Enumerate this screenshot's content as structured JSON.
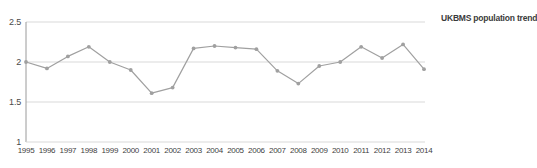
{
  "chart_data": {
    "type": "line",
    "title": "",
    "subtitle": "",
    "xlabel": "",
    "ylabel": "",
    "x": [
      1995,
      1996,
      1997,
      1998,
      1999,
      2000,
      2001,
      2002,
      2003,
      2004,
      2005,
      2006,
      2007,
      2008,
      2009,
      2010,
      2011,
      2012,
      2013,
      2014
    ],
    "categories": [
      "1995",
      "1996",
      "1997",
      "1998",
      "1999",
      "2000",
      "2001",
      "2002",
      "2003",
      "2004",
      "2005",
      "2006",
      "2007",
      "2008",
      "2009",
      "2010",
      "2011",
      "2012",
      "2013",
      "2014"
    ],
    "series": [
      {
        "name": "UKBMS population trend",
        "values": [
          2.0,
          1.92,
          2.07,
          2.19,
          2.0,
          1.9,
          1.61,
          1.68,
          2.17,
          2.2,
          2.18,
          2.16,
          1.89,
          1.73,
          1.95,
          2.0,
          2.19,
          2.05,
          2.22,
          1.91
        ],
        "color": "#a0a0a0",
        "marker": "circle"
      }
    ],
    "legend": {
      "position": "right",
      "entries": [
        "UKBMS population trend"
      ]
    },
    "yticks": [
      1,
      1.5,
      2,
      2.5
    ],
    "ytick_labels": [
      "1",
      "1.5",
      "2",
      "2.5"
    ],
    "ylim": [
      1,
      2.5
    ],
    "xlim": [
      1995,
      2014
    ],
    "grid": {
      "horizontal": true,
      "vertical": false,
      "color": "#d9d9d9"
    },
    "axis_color": "#9a9a9a"
  },
  "legend": {
    "label": "UKBMS population trend"
  }
}
